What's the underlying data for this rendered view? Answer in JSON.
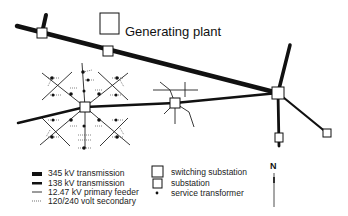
{
  "diagram": {
    "labels": {
      "generating_plant": "Generating plant",
      "north": "N"
    },
    "colors": {
      "line": "#111111",
      "background": "#ffffff",
      "substation_fill": "#ffffff"
    },
    "nodes": [
      {
        "id": "substation-upper-left",
        "type": "substation",
        "x": 42,
        "y": 33
      },
      {
        "id": "generating-plant",
        "type": "generating plant",
        "x": 110,
        "y": 25
      },
      {
        "id": "plant-substation",
        "type": "substation",
        "x": 108,
        "y": 51
      },
      {
        "id": "switching-substation-right",
        "type": "switching substation",
        "x": 278,
        "y": 93
      },
      {
        "id": "substation-grid-center",
        "type": "substation",
        "x": 85,
        "y": 107
      },
      {
        "id": "substation-middle",
        "type": "substation",
        "x": 175,
        "y": 103
      },
      {
        "id": "substation-lower-right-1",
        "type": "substation",
        "x": 279,
        "y": 138
      },
      {
        "id": "substation-lower-right-2",
        "type": "substation",
        "x": 327,
        "y": 133
      }
    ],
    "legend": {
      "lines": [
        {
          "label": "345 kV transmission",
          "weight": "heaviest"
        },
        {
          "label": "138 kV transmission",
          "weight": "heavy"
        },
        {
          "label": "12.47 kV primary feeder",
          "weight": "thin"
        },
        {
          "label": "120/240 volt secondary",
          "weight": "dotted"
        }
      ],
      "symbols": [
        {
          "label": "switching substation",
          "symbol": "large-square"
        },
        {
          "label": "substation",
          "symbol": "small-square"
        },
        {
          "label": "service transformer",
          "symbol": "dot"
        }
      ]
    }
  }
}
